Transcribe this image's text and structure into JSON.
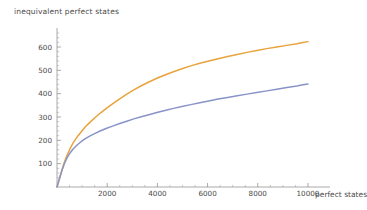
{
  "chart_data": {
    "type": "line",
    "title": "inequivalent perfect states",
    "xlabel": "perfect states",
    "ylabel": "inequivalent perfect states",
    "xlim": [
      0,
      10400
    ],
    "ylim": [
      0,
      660
    ],
    "grid": false,
    "legend": "none",
    "xticks": [
      2000,
      4000,
      6000,
      8000,
      10000
    ],
    "yticks": [
      100,
      200,
      300,
      400,
      500,
      600
    ],
    "xtick_labels": [
      "2000",
      "4000",
      "6000",
      "8000",
      "10000"
    ],
    "ytick_labels": [
      "100",
      "200",
      "300",
      "400",
      "500",
      "600"
    ],
    "x_minor_interval": 500,
    "y_minor_interval": 20,
    "series": [
      {
        "name": "upper-curve",
        "color": "#E8A33D",
        "x": [
          0,
          60,
          130,
          210,
          300,
          400,
          520,
          650,
          800,
          960,
          1130,
          1320,
          1520,
          1740,
          1980,
          2240,
          2500,
          2780,
          3060,
          3360,
          3660,
          3980,
          4300,
          4640,
          4980,
          5330,
          5690,
          6050,
          6420,
          6800,
          7180,
          7570,
          7960,
          8360,
          8760,
          9160,
          9560,
          9800,
          10000
        ],
        "y": [
          0,
          22,
          48,
          78,
          108,
          136,
          164,
          190,
          214,
          236,
          258,
          278,
          298,
          318,
          338,
          358,
          378,
          398,
          416,
          434,
          450,
          466,
          480,
          494,
          507,
          519,
          530,
          540,
          550,
          559,
          568,
          577,
          585,
          593,
          600,
          607,
          614,
          619,
          623
        ]
      },
      {
        "name": "lower-curve",
        "color": "#8894C8",
        "x": [
          0,
          60,
          130,
          210,
          300,
          400,
          520,
          650,
          800,
          960,
          1130,
          1320,
          1520,
          1740,
          1980,
          2240,
          2500,
          2780,
          3060,
          3360,
          3660,
          3980,
          4300,
          4640,
          4980,
          5330,
          5690,
          6050,
          6420,
          6800,
          7180,
          7570,
          7960,
          8360,
          8760,
          9160,
          9560,
          9800,
          10000
        ],
        "y": [
          0,
          22,
          47,
          75,
          102,
          125,
          146,
          164,
          180,
          194,
          207,
          219,
          230,
          241,
          252,
          262,
          272,
          282,
          292,
          301,
          310,
          319,
          328,
          337,
          345,
          353,
          361,
          369,
          377,
          384,
          391,
          398,
          405,
          412,
          419,
          426,
          433,
          438,
          441
        ]
      }
    ]
  }
}
